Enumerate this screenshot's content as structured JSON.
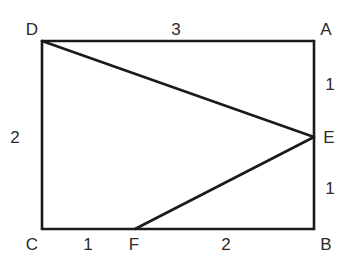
{
  "diagram": {
    "type": "geometry-rectangle",
    "points": {
      "A": {
        "label": "A",
        "x": 314,
        "y": 41
      },
      "B": {
        "label": "B",
        "x": 314,
        "y": 229
      },
      "C": {
        "label": "C",
        "x": 42,
        "y": 229
      },
      "D": {
        "label": "D",
        "x": 42,
        "y": 41
      },
      "E": {
        "label": "E",
        "x": 314,
        "y": 137
      },
      "F": {
        "label": "F",
        "x": 135,
        "y": 229
      }
    },
    "segments": [
      {
        "from": "D",
        "to": "A",
        "length_label": "3"
      },
      {
        "from": "A",
        "to": "E",
        "length_label": "1"
      },
      {
        "from": "E",
        "to": "B",
        "length_label": "1"
      },
      {
        "from": "C",
        "to": "F",
        "length_label": "1"
      },
      {
        "from": "F",
        "to": "B",
        "length_label": "2"
      },
      {
        "from": "D",
        "to": "C",
        "length_label": "2"
      },
      {
        "from": "D",
        "to": "E",
        "length_label": ""
      },
      {
        "from": "F",
        "to": "E",
        "length_label": ""
      }
    ],
    "vertex_labels": {
      "D": "D",
      "A": "A",
      "E": "E",
      "C": "C",
      "F": "F",
      "B": "B"
    },
    "length_labels": {
      "DA": "3",
      "AE": "1",
      "EB": "1",
      "DC": "2",
      "CF": "1",
      "FB": "2"
    }
  }
}
